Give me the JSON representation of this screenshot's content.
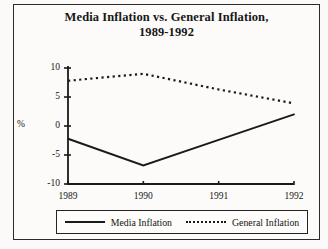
{
  "figure": {
    "title_line1": "Media Inflation vs. General Inflation,",
    "title_line2": "1989-1992",
    "y_axis_label": "%",
    "background_color": "#fbfaf8",
    "line_color": "#1a1a1a"
  },
  "legend": {
    "entries": [
      {
        "label": "Media Inflation",
        "style": "solid"
      },
      {
        "label": "General Inflation",
        "style": "dotted"
      }
    ]
  },
  "chart_data": {
    "type": "line",
    "title": "Media Inflation vs. General Inflation, 1989-1992",
    "xlabel": "",
    "ylabel": "%",
    "categories": [
      "1989",
      "1990",
      "1991",
      "1992"
    ],
    "x": [
      1989,
      1990,
      1991,
      1992
    ],
    "xlim": [
      1989,
      1992
    ],
    "ylim": [
      -10,
      10
    ],
    "yticks": [
      10,
      5,
      0,
      -5,
      -10
    ],
    "ytick_labels": [
      "10",
      "5",
      "0",
      "-5",
      "-10"
    ],
    "xticks": [
      1989,
      1990,
      1991,
      1992
    ],
    "grid": false,
    "legend_position": "bottom",
    "series": [
      {
        "name": "Media Inflation",
        "style": "solid",
        "color": "#1a1a1a",
        "values": [
          -2.2,
          -6.8,
          -2.4,
          2.0
        ]
      },
      {
        "name": "General Inflation",
        "style": "dotted",
        "color": "#1a1a1a",
        "values": [
          7.8,
          9.0,
          6.3,
          3.9
        ]
      }
    ]
  }
}
